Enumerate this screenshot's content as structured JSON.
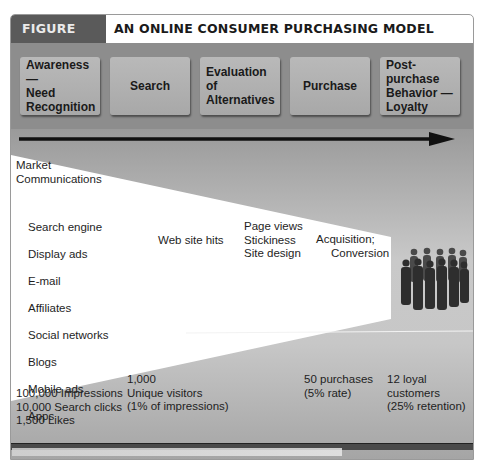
{
  "header": {
    "figure_label": "FIGURE 6.11",
    "title": "AN ONLINE CONSUMER PURCHASING MODEL"
  },
  "stages": [
    {
      "label": "Awareness —\nNeed\nRecognition"
    },
    {
      "label": "Search"
    },
    {
      "label": "Evaluation\nof\nAlternatives"
    },
    {
      "label": "Purchase"
    },
    {
      "label": "Post-purchase\nBehavior —\nLoyalty"
    }
  ],
  "funnel": {
    "market_communications": "Market\nCommunications",
    "channels": [
      "Search engine",
      "Display ads",
      "E-mail",
      "Affiliates",
      "Social networks",
      "Blogs",
      "Mobile ads",
      "Apps"
    ],
    "web_site_hits": "Web site hits",
    "site_factors": "Page views\nStickiness\nSite design",
    "acquisition": "Acquisition;",
    "conversion": "Conversion"
  },
  "metrics": [
    {
      "text": "100,000 Impressions\n10,000 Search clicks\n1,500 Likes"
    },
    {
      "text": "1,000\nUnique visitors\n(1% of impressions)"
    },
    {
      "text": "50 purchases\n(5% rate)"
    },
    {
      "text": "12 loyal\ncustomers\n(25% retention)"
    }
  ],
  "icons": {
    "arrow": "right-arrow-icon",
    "people": "customer-group-icon"
  },
  "colors": {
    "header_dark": "#5a5a5a",
    "stage_band": "#8d8d8d",
    "stage_box": "#b3b3b3",
    "funnel_gray": "#c4c4c4",
    "wedge": "#ffffff"
  }
}
